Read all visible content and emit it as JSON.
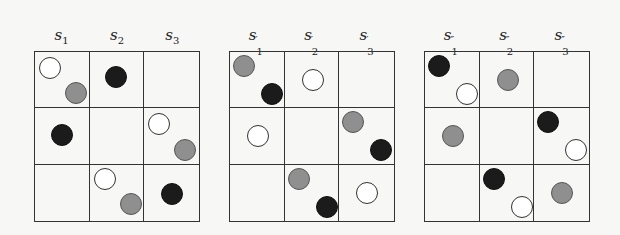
{
  "panels": [
    {
      "id": "s",
      "left": 34,
      "labels": [
        {
          "base": "s",
          "sub": "1",
          "prime": ""
        },
        {
          "base": "s",
          "sub": "2",
          "prime": ""
        },
        {
          "base": "s",
          "sub": "3",
          "prime": ""
        }
      ],
      "cells": [
        [
          [
            {
              "color": "white",
              "x": 4,
              "y": 5
            },
            {
              "color": "gray",
              "x": 30,
              "y": 30
            }
          ],
          [
            {
              "color": "black",
              "x": 15,
              "y": 14
            }
          ],
          []
        ],
        [
          [
            {
              "color": "black",
              "x": 16,
              "y": 16
            }
          ],
          [],
          [
            {
              "color": "white",
              "x": 4,
              "y": 5
            },
            {
              "color": "gray",
              "x": 30,
              "y": 31
            }
          ]
        ],
        [
          [],
          [
            {
              "color": "white",
              "x": 4,
              "y": 3
            },
            {
              "color": "gray",
              "x": 30,
              "y": 28
            }
          ],
          [
            {
              "color": "black",
              "x": 17,
              "y": 18
            }
          ]
        ]
      ]
    },
    {
      "id": "s-prime",
      "left": 229,
      "labels": [
        {
          "base": "s",
          "sub": "1",
          "prime": "′"
        },
        {
          "base": "s",
          "sub": "2",
          "prime": "′"
        },
        {
          "base": "s",
          "sub": "3",
          "prime": "′"
        }
      ],
      "cells": [
        [
          [
            {
              "color": "gray",
              "x": 3,
              "y": 3
            },
            {
              "color": "black",
              "x": 31,
              "y": 31
            }
          ],
          [
            {
              "color": "white",
              "x": 17,
              "y": 17
            }
          ],
          []
        ],
        [
          [
            {
              "color": "white",
              "x": 17,
              "y": 17
            }
          ],
          [],
          [
            {
              "color": "gray",
              "x": 3,
              "y": 3
            },
            {
              "color": "black",
              "x": 31,
              "y": 31
            }
          ]
        ],
        [
          [],
          [
            {
              "color": "gray",
              "x": 3,
              "y": 3
            },
            {
              "color": "black",
              "x": 31,
              "y": 31
            }
          ],
          [
            {
              "color": "white",
              "x": 17,
              "y": 17
            }
          ]
        ]
      ]
    },
    {
      "id": "s-double-prime",
      "left": 424,
      "labels": [
        {
          "base": "s",
          "sub": "1",
          "prime": "″"
        },
        {
          "base": "s",
          "sub": "2",
          "prime": "″"
        },
        {
          "base": "s",
          "sub": "3",
          "prime": "″"
        }
      ],
      "cells": [
        [
          [
            {
              "color": "black",
              "x": 3,
              "y": 3
            },
            {
              "color": "white",
              "x": 31,
              "y": 31
            }
          ],
          [
            {
              "color": "gray",
              "x": 17,
              "y": 17
            }
          ],
          []
        ],
        [
          [
            {
              "color": "gray",
              "x": 17,
              "y": 17
            }
          ],
          [],
          [
            {
              "color": "black",
              "x": 3,
              "y": 3
            },
            {
              "color": "white",
              "x": 31,
              "y": 31
            }
          ]
        ],
        [
          [],
          [
            {
              "color": "black",
              "x": 3,
              "y": 3
            },
            {
              "color": "white",
              "x": 31,
              "y": 31
            }
          ],
          [
            {
              "color": "gray",
              "x": 17,
              "y": 17
            }
          ]
        ]
      ]
    }
  ]
}
